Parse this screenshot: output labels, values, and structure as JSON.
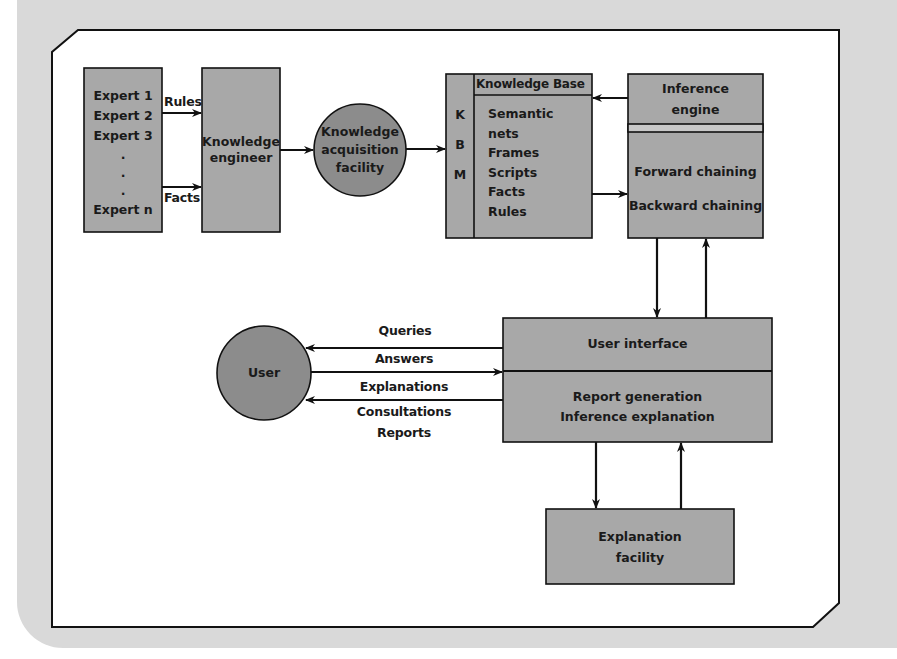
{
  "diagram": {
    "type": "expert-system-architecture",
    "colors": {
      "background_panel": "#d9d9d9",
      "frame_fill": "#ffffff",
      "node_fill": "#a8a8a8",
      "circle_fill": "#8c8c8c",
      "stroke": "#111111",
      "text": "#1a1a1a"
    },
    "nodes": {
      "experts": {
        "lines": [
          "Expert 1",
          "Expert 2",
          "Expert 3",
          ".",
          ".",
          ".",
          "Expert n"
        ]
      },
      "knowledge_engineer": {
        "line1": "Knowledge",
        "line2": "engineer"
      },
      "knowledge_acquisition": {
        "line1": "Knowledge",
        "line2": "acquisition",
        "line3": "facility"
      },
      "knowledge_base": {
        "side_letters": [
          "K",
          "B",
          "M"
        ],
        "header": "Knowledge Base",
        "items": [
          "Semantic",
          "nets",
          "Frames",
          "Scripts",
          "Facts",
          "Rules"
        ]
      },
      "inference_engine": {
        "title_line1": "Inference",
        "title_line2": "engine",
        "methods": [
          "Forward chaining",
          "Backward chaining"
        ]
      },
      "user": {
        "label": "User"
      },
      "user_interface": {
        "top": "User interface",
        "bottom_line1": "Report generation",
        "bottom_line2": "Inference explanation"
      },
      "explanation_facility": {
        "line1": "Explanation",
        "line2": "facility"
      }
    },
    "edge_labels": {
      "rules": "Rules",
      "facts": "Facts",
      "queries": "Queries",
      "answers": "Answers",
      "explanations": "Explanations",
      "consultations": "Consultations",
      "reports": "Reports"
    },
    "edges": [
      {
        "from": "experts",
        "to": "knowledge_engineer",
        "label": "Rules"
      },
      {
        "from": "experts",
        "to": "knowledge_engineer",
        "label": "Facts"
      },
      {
        "from": "knowledge_engineer",
        "to": "knowledge_acquisition"
      },
      {
        "from": "knowledge_acquisition",
        "to": "knowledge_base"
      },
      {
        "from": "inference_engine",
        "to": "knowledge_base"
      },
      {
        "from": "knowledge_base",
        "to": "inference_engine"
      },
      {
        "from": "inference_engine",
        "to": "user_interface"
      },
      {
        "from": "user_interface",
        "to": "inference_engine"
      },
      {
        "from": "user_interface",
        "to": "user",
        "label": "Queries"
      },
      {
        "from": "user",
        "to": "user_interface",
        "label": "Answers"
      },
      {
        "from": "user_interface",
        "to": "user",
        "label": "Explanations / Consultations / Reports"
      },
      {
        "from": "user_interface",
        "to": "explanation_facility"
      },
      {
        "from": "explanation_facility",
        "to": "user_interface"
      }
    ]
  }
}
